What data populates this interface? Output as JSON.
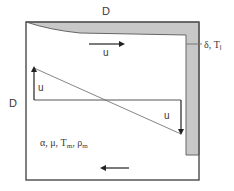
{
  "diagram": {
    "type": "schematic",
    "labels": {
      "top_dimension": "D",
      "left_dimension": "D",
      "film_label": "δ, T",
      "film_label_sub": "l",
      "top_velocity": "u",
      "profile_left_velocity": "u",
      "profile_right_velocity": "u",
      "properties_alpha_mu": "α, μ, T",
      "properties_Tm_sub": "m",
      "properties_sep": ", ρ",
      "properties_rho_sub": "m"
    },
    "colors": {
      "outline": "#555555",
      "film_fill": "#c8c8c8",
      "profile_line": "#666666",
      "arrow": "#222222",
      "text": "#3a3a3a"
    },
    "arrows": [
      {
        "name": "top-flow-arrow",
        "direction": "right"
      },
      {
        "name": "bottom-flow-arrow",
        "direction": "left"
      },
      {
        "name": "profile-up-arrow",
        "direction": "up"
      },
      {
        "name": "profile-down-arrow",
        "direction": "down"
      }
    ]
  }
}
